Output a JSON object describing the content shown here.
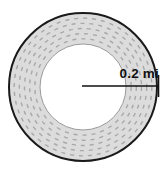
{
  "figure": {
    "kind": "circular-running-track-diagram",
    "width": 168,
    "height": 176,
    "background_color": "#ffffff"
  },
  "track": {
    "center_x": 83,
    "center_y": 87,
    "outer_radius": 74,
    "inner_radius": 43,
    "band_fill_color": "#dcdcdc",
    "outer_stroke_color": "#1a1a1a",
    "outer_stroke_width": 2,
    "inner_stroke_color": "#9a9a9a",
    "inner_stroke_width": 1,
    "lane_count": 5,
    "lane_dash_color": "#a8a8a8",
    "lane_dash_pattern": "4 5"
  },
  "radius_measure": {
    "label": "0.2 mi",
    "line_color": "#111111",
    "line_width": 1.6,
    "start_x": 82,
    "end_x": 159,
    "y": 86,
    "end_tick_height": 22
  },
  "chart_data": {
    "type": "diagram",
    "annotations": [
      {
        "text": "0.2 mi",
        "measures": "radius",
        "value": 0.2,
        "unit": "mi"
      }
    ]
  }
}
